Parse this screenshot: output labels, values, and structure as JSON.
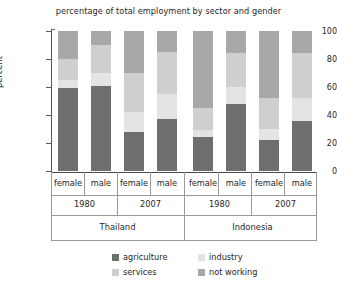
{
  "chart_data": {
    "type": "bar",
    "subtype": "stacked-bar-100",
    "title": "percentage of total employment by sector and gender",
    "xlabel": "",
    "ylabel": "percent",
    "ylim": [
      0,
      100
    ],
    "yticks": [
      0,
      20,
      40,
      60,
      80,
      100
    ],
    "ytick_labels": [
      "0",
      "20",
      "40",
      "60",
      "80",
      "100"
    ],
    "grid": false,
    "legend_position": "bottom",
    "categories": [
      "Thailand 1980 female",
      "Thailand 1980 male",
      "Thailand 2007 female",
      "Thailand 2007 male",
      "Indonesia 1980 female",
      "Indonesia 1980 male",
      "Indonesia 2007 female",
      "Indonesia 2007 male"
    ],
    "series": [
      {
        "name": "agriculture",
        "color": "#6e6e6e",
        "values": [
          59,
          61,
          28,
          37,
          24,
          48,
          22,
          36
        ]
      },
      {
        "name": "industry",
        "color": "#e4e4e4",
        "values": [
          6,
          9,
          14,
          18,
          5,
          12,
          8,
          16
        ]
      },
      {
        "name": "services",
        "color": "#cfcfcf",
        "values": [
          15,
          20,
          28,
          30,
          16,
          24,
          22,
          32
        ]
      },
      {
        "name": "not working",
        "color": "#a8a8a8",
        "values": [
          20,
          10,
          30,
          15,
          55,
          16,
          48,
          16
        ]
      }
    ]
  },
  "axis": {
    "y_label": "percent",
    "y_ticks": [
      "100",
      "80",
      "60",
      "40",
      "20",
      "0"
    ]
  },
  "groups": {
    "genders": [
      "female",
      "male",
      "female",
      "male",
      "female",
      "male",
      "female",
      "male"
    ],
    "years": [
      "1980",
      "2007",
      "1980",
      "2007"
    ],
    "countries": [
      "Thailand",
      "Indonesia"
    ]
  },
  "legend": {
    "items": [
      {
        "label": "agriculture",
        "color": "#6e6e6e"
      },
      {
        "label": "industry",
        "color": "#e4e4e4"
      },
      {
        "label": "services",
        "color": "#cfcfcf"
      },
      {
        "label": "not working",
        "color": "#a8a8a8"
      }
    ]
  }
}
